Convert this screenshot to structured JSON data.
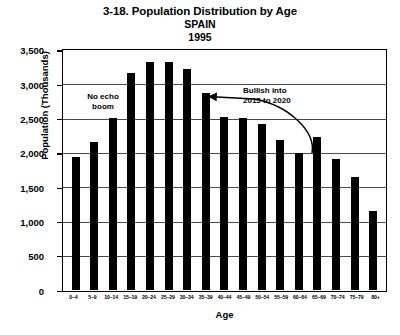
{
  "chart_data": {
    "type": "bar",
    "title": "3-18. Population Distribution by Age",
    "subtitle": "SPAIN",
    "year": "1995",
    "xlabel": "Age",
    "ylabel": "Population (Thousands)",
    "grid": true,
    "legend": "none",
    "ylim": [
      0,
      3500
    ],
    "yticks": [
      3500,
      3000,
      2500,
      2000,
      1500,
      1000,
      500,
      0
    ],
    "ytick_labels": [
      "3,500",
      "3,000",
      "2,500",
      "2,000",
      "1,500",
      "1,000",
      "500",
      "0"
    ],
    "categories": [
      "0–4",
      "5–9",
      "10–14",
      "15–19",
      "20–24",
      "25–29",
      "30–34",
      "35–39",
      "40–44",
      "45–49",
      "50–54",
      "55–59",
      "60–64",
      "65–69",
      "70–74",
      "75–79",
      "80+"
    ],
    "values": [
      1930,
      2150,
      2500,
      3150,
      3320,
      3320,
      3220,
      2870,
      2510,
      2500,
      2420,
      2180,
      1990,
      2230,
      1900,
      1640,
      1150
    ],
    "bar_color": "#000000",
    "annotations": [
      {
        "id": "no-echo-boom",
        "text": "No echo\nboom"
      },
      {
        "id": "bullish",
        "text": "Bullish into\n2015 to 2020"
      }
    ]
  },
  "chart": {
    "title": "3-18. Population Distribution by Age",
    "subtitle": "SPAIN",
    "year": "1995",
    "y_axis_title": "Population (Thousands)",
    "x_axis_title": "Age",
    "annotation_no_echo": "No echo\nboom",
    "annotation_bullish": "Bullish into\n2015 to 2020"
  }
}
